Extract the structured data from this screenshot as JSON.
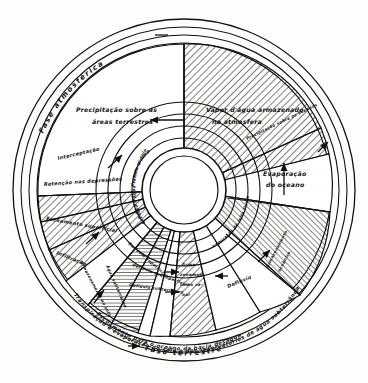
{
  "figure": {
    "type": "circular-cycle-diagram",
    "language": "pt-BR",
    "ink_color": "#111111",
    "paper_color": "#fdfdfb"
  },
  "rings": {
    "outer_top_label": "Fase atmosférica",
    "outer_bottom_label": "Fase terrestre",
    "inner_arc_bottom": "Transpiração e evaporação do solo e dos reservatórios de água subterrânea",
    "inner_arc_bottom2": "Escoamento para o oceano da bacia deságua",
    "inner_arc_right": "reservatórios de água superficial"
  },
  "sectors": [
    {
      "id": "precipitacao-terrestre",
      "label": "Precipitação sobre as áreas terrestres",
      "hatched": false
    },
    {
      "id": "vapor-atmosfera",
      "label": "Vapor d'água armazenado na atmosfera",
      "hatched": true
    },
    {
      "id": "precipitacao-oceano",
      "label": "Precipitação sobre os oceanos",
      "hatched": true
    },
    {
      "id": "evaporacao-oceano",
      "label": "Evaporação do oceano",
      "hatched": false
    },
    {
      "id": "armazenamento-oceanico",
      "label": "Armazenamento oceânico",
      "hatched": true
    },
    {
      "id": "interceptacao",
      "label": "Interceptação",
      "hatched": true
    },
    {
      "id": "retencao-depressoes",
      "label": "Retenção nas depressões",
      "hatched": true
    },
    {
      "id": "escoamento-superficial",
      "label": "Escoamento superficial",
      "hatched": true
    },
    {
      "id": "infiltracao",
      "label": "Infiltração",
      "hatched": false
    },
    {
      "id": "armazenamento-solo",
      "label": "Armazenamento no solo",
      "hatched": true
    },
    {
      "id": "agua-subterranea",
      "label": "Água subterrânea",
      "hatched": true
    },
    {
      "id": "defluvio-superficial",
      "label": "Deflúvio superficial",
      "hatched": false
    },
    {
      "id": "defluvio-subsuperficial",
      "label": "Deflúvio subsuperficial",
      "hatched": false
    },
    {
      "id": "defluvio-subterraneo",
      "label": "Deflúvio subterrâneo",
      "hatched": false
    },
    {
      "id": "armazenamento-canal",
      "label": "Armazenamento no canal",
      "hatched": true
    },
    {
      "id": "defluvio",
      "label": "Deflúvio",
      "hatched": false
    },
    {
      "id": "evaporacao-leito-fluvial",
      "label": "Evaporação do leito fluvial",
      "hatched": false
    },
    {
      "id": "excesso-precip-tempestade",
      "label": "Excesso de precip. durante a tempestade",
      "hatched": false
    },
    {
      "id": "excesso-agua-retida",
      "label": "Excesso d'água retida ao solo",
      "hatched": false
    }
  ],
  "labels": {
    "precipitacao_terrestre_l1": "Precipitação sobre as",
    "precipitacao_terrestre_l2": "áreas terrestres",
    "vapor_l1": "Vapor d'água armazenado",
    "vapor_l2": "na atmosfera",
    "evaporacao_oceano_l1": "Evaporação",
    "evaporacao_oceano_l2": "do oceano",
    "interceptacao": "Interceptação",
    "retencao": "Retenção nas depressões",
    "escoamento_superficial": "Escoamento superficial",
    "infiltracao": "Infiltração",
    "defluvio_superficial": "Deflúvio superficial",
    "defluvio_subsuperficial": "Deflúvio subsuperficial",
    "defluvio_subterraneo": "Deflúvio subterrâneo",
    "defluvio": "Deflúvio",
    "armazenamento_canal_l1": "Arma-",
    "armazenamento_canal_l2": "zenamen-",
    "armazenamento_canal_l3": "to no ca-",
    "armazenamento_canal_l4": "nal",
    "evaporacao_leito": "Evaporação do leito fluvial",
    "excesso_precip": "Excesso de precip. durante a tempestade",
    "excesso_agua": "Excesso d'água retida ao solo",
    "precipitacao_oceano": "Precipitação sobre os oceanos",
    "armazenamento_oceanico_l1": "Armazenamento",
    "armazenamento_oceanico_l2": "oceânico",
    "armazenamento_solo": "Armazenamento no solo",
    "agua_subterranea": "Água subterrânea"
  },
  "geometry": {
    "cx": 184,
    "cy": 190,
    "r_outer": 172,
    "r_ring_in": 150,
    "r_sector_out": 140,
    "r_hub": 42
  }
}
